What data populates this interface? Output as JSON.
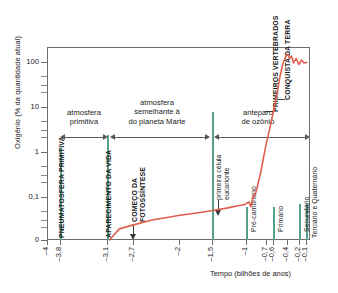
{
  "chart_data": {
    "type": "line",
    "title": "",
    "xlabel": "Tempo (bilhões de anos)",
    "ylabel": "Oxigênio (% da quantidade atual)",
    "yscale": "log",
    "ylim": [
      0,
      200
    ],
    "xlim": [
      -4,
      0
    ],
    "grid": false,
    "legend_position": "none",
    "ytick_labels": [
      "100",
      "10",
      "1",
      "0,1",
      "0"
    ],
    "ytick_values": [
      100,
      10,
      1,
      0.1,
      0
    ],
    "xtick_labels": [
      "–4",
      "–3,8",
      "–3,1",
      "–2,7",
      "–2",
      "–1,5",
      "–1",
      "–0,7",
      "–0,6",
      "–0,4",
      "–0,2",
      "–0,1"
    ],
    "xtick_values": [
      -4,
      -3.8,
      -3.1,
      -2.7,
      -2,
      -1.5,
      -1,
      -0.7,
      -0.6,
      -0.4,
      -0.2,
      -0.1
    ],
    "series": [
      {
        "name": "Oxigênio atmosférico",
        "color": "#e0604c",
        "points": [
          [
            -3.05,
            0.0
          ],
          [
            -2.9,
            0.004
          ],
          [
            -2.7,
            0.008
          ],
          [
            -2.4,
            0.016
          ],
          [
            -2.0,
            0.026
          ],
          [
            -1.7,
            0.034
          ],
          [
            -1.5,
            0.04
          ],
          [
            -1.25,
            0.05
          ],
          [
            -1.1,
            0.058
          ],
          [
            -1.0,
            0.062
          ],
          [
            -0.93,
            0.075
          ],
          [
            -0.9,
            0.055
          ],
          [
            -0.87,
            0.095
          ],
          [
            -0.82,
            0.13
          ],
          [
            -0.75,
            0.35
          ],
          [
            -0.68,
            1.2
          ],
          [
            -0.6,
            4.0
          ],
          [
            -0.52,
            14
          ],
          [
            -0.46,
            45
          ],
          [
            -0.41,
            95
          ],
          [
            -0.37,
            130
          ],
          [
            -0.34,
            148
          ],
          [
            -0.31,
            120
          ],
          [
            -0.28,
            135
          ],
          [
            -0.25,
            95
          ],
          [
            -0.21,
            120
          ],
          [
            -0.17,
            88
          ],
          [
            -0.13,
            110
          ],
          [
            -0.09,
            95
          ],
          [
            -0.05,
            98
          ]
        ]
      }
    ],
    "event_lines": [
      {
        "x": -3.8,
        "label": "PNEUMATOSFERA PRIMITIVA",
        "color": "#55a08c",
        "style": "caps"
      },
      {
        "x": -3.1,
        "label": "APARECIMENTO DA VIDA",
        "color": "#55a08c",
        "style": "caps"
      },
      {
        "x": -1.5,
        "label": "",
        "color": "#55a08c",
        "style": "plain"
      },
      {
        "x": -1.0,
        "label": "Pré-cambriano",
        "color": "#55a08c",
        "style": "era"
      },
      {
        "x": -0.6,
        "label": "Primário",
        "color": "#55a08c",
        "style": "era"
      },
      {
        "x": -0.2,
        "label": "Secundário",
        "color": "#55a08c",
        "style": "era"
      },
      {
        "x": -0.1,
        "label": "Terciário e Quaternário",
        "color": "#55a08c",
        "style": "era"
      }
    ],
    "annotations": [
      {
        "name": "atmosfera-primitiva",
        "text": "atmosfera\nprimitiva",
        "span": [
          -3.8,
          -3.1
        ]
      },
      {
        "name": "atmosfera-marte",
        "text": "atmosfera\nsemelhante à\ndo planeta Marte",
        "span": [
          -3.1,
          -1.5
        ]
      },
      {
        "name": "anteparo-ozonio",
        "text": "anteparo\nde ozônio",
        "span": [
          -1.5,
          -0.02
        ]
      },
      {
        "name": "comeco-fotossintese",
        "text": "COMEÇO DA FOTOSSÍNTESE",
        "at": -2.7
      },
      {
        "name": "primeira-celula-eucarionte",
        "text": "primeira célula eucarionte",
        "at": -0.9
      },
      {
        "name": "primeiros-vertebrados",
        "text": "PRIMEIROS VERTEBRADOS",
        "at": -0.44
      },
      {
        "name": "conquista-da-terra",
        "text": "CONQUISTA DA TERRA",
        "at": -0.38
      }
    ]
  },
  "axes": {
    "ylabel": "Oxigênio (% da quantidade atual)",
    "xlabel": "Tempo (bilhões de anos)",
    "yticks": [
      {
        "label": "100",
        "top": 62
      },
      {
        "label": "10",
        "top": 107
      },
      {
        "label": "1",
        "top": 152
      },
      {
        "label": "0,1",
        "top": 197
      },
      {
        "label": "0",
        "top": 240
      }
    ],
    "yminor": [
      {
        "top": 76
      },
      {
        "top": 85
      },
      {
        "top": 92
      },
      {
        "top": 121
      },
      {
        "top": 130
      },
      {
        "top": 137
      },
      {
        "top": 166
      },
      {
        "top": 175
      },
      {
        "top": 182
      },
      {
        "top": 211
      },
      {
        "top": 220
      },
      {
        "top": 227
      }
    ],
    "xticks": [
      {
        "label": "–4",
        "left": 47
      },
      {
        "label": "–3,8",
        "left": 60
      },
      {
        "label": "–3,1",
        "left": 107
      },
      {
        "label": "–2,7",
        "left": 133
      },
      {
        "label": "–2",
        "left": 179
      },
      {
        "label": "–1,5",
        "left": 212
      },
      {
        "label": "–1",
        "left": 246
      },
      {
        "label": "–0,7",
        "left": 266
      },
      {
        "label": "–0,6",
        "left": 272
      },
      {
        "label": "–0,4",
        "left": 286
      },
      {
        "label": "–0,2",
        "left": 299
      },
      {
        "label": "–0,1",
        "left": 306
      }
    ]
  },
  "vertical_labels": {
    "pneumatosfera": "PNEUMATOSFERA PRIMITIVA",
    "aparecimento": "APARECIMENTO DA VIDA",
    "fotossintese_l1": "COMEÇO DA",
    "fotossintese_l2": "FOTOSSÍNTESE",
    "eucarionte_l1": "primeira célula",
    "eucarionte_l2": "eucarionte",
    "vertebrados": "PRIMEIROS VERTEBRADOS",
    "conquista": "CONQUISTA DA TERRA",
    "era_precambriano": "Pré-cambriano",
    "era_primario": "Primário",
    "era_secundario": "Secundário",
    "era_terciario": "Terciário e Quaternário"
  },
  "band_labels": {
    "primitiva_l1": "atmosfera",
    "primitiva_l2": "primitiva",
    "marte_l1": "atmosfera",
    "marte_l2": "semelhante à",
    "marte_l3": "do planeta Marte",
    "ozonio_l1": "anteparo",
    "ozonio_l2": "de ozônio"
  },
  "colors": {
    "curve": "#e0604c",
    "event_line": "#55a08c",
    "axis": "#6d6d6d",
    "text": "#1a1a1a"
  }
}
